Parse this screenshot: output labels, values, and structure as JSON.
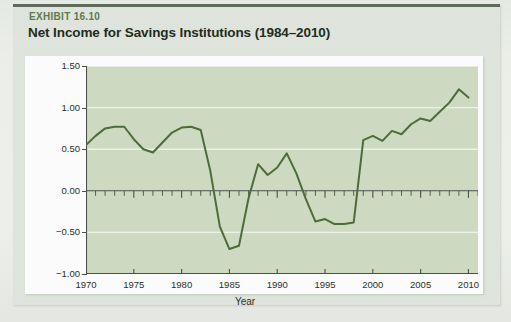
{
  "exhibit": {
    "label": "EXHIBIT 16.10",
    "title": "Net Income for Savings Institutions (1984–2010)",
    "label_color": "#5d7a4e",
    "title_color": "#1d2b20",
    "card_bg": "#dfe5dc",
    "panel_bg": "#fbfcfb",
    "rule_color": "#5e6b5c"
  },
  "chart_data": {
    "type": "line",
    "title": "Net Income for Savings Institutions (1984–2010)",
    "xlabel": "Year",
    "ylabel": "Percent of assets",
    "xlim": [
      1970,
      2011
    ],
    "ylim": [
      -1.0,
      1.5
    ],
    "xticks": [
      1970,
      1975,
      1980,
      1985,
      1990,
      1995,
      2000,
      2005,
      2010
    ],
    "xtick_labels": [
      "1970",
      "1975",
      "1980",
      "1985",
      "1990",
      "1995",
      "2000",
      "2005",
      "2010"
    ],
    "yticks": [
      -1.0,
      -0.5,
      0.0,
      0.5,
      1.0,
      1.5
    ],
    "ytick_labels": [
      "−1.00",
      "−0.50",
      "0.00",
      "0.50",
      "1.00",
      "1.50"
    ],
    "minor_x_tick_interval": 1,
    "grid": true,
    "grid_color": "#eef3ea",
    "plot_bg": "#cddbc1",
    "legend": null,
    "line_color": "#4e6b3b",
    "line_width": 2.0,
    "series": [
      {
        "name": "Net income",
        "x": [
          1970,
          1971,
          1972,
          1973,
          1974,
          1975,
          1976,
          1977,
          1978,
          1979,
          1980,
          1981,
          1982,
          1983,
          1984,
          1985,
          1986,
          1987,
          1988,
          1989,
          1990,
          1991,
          1992,
          1993,
          1994,
          1995,
          1996,
          1997,
          1998,
          1999,
          2000,
          2001,
          2002,
          2003,
          2004,
          2005,
          2006,
          2007,
          2008,
          2009,
          2010
        ],
        "values": [
          0.55,
          0.66,
          0.75,
          0.77,
          0.77,
          0.62,
          0.5,
          0.46,
          0.58,
          0.7,
          0.76,
          0.77,
          0.73,
          0.24,
          -0.43,
          -0.7,
          -0.66,
          -0.09,
          0.32,
          0.19,
          0.28,
          0.45,
          0.21,
          -0.1,
          -0.37,
          -0.34,
          -0.4,
          -0.4,
          -0.38,
          0.61,
          0.66,
          0.6,
          0.72,
          0.68,
          0.8,
          0.87,
          0.84,
          0.95,
          1.06,
          1.22,
          1.12
        ]
      }
    ],
    "note": "Line traced from the figure; the 1980s S&L crisis trough and the 2008 crisis trough are the two deepest points."
  },
  "axes": {
    "y_label": "Percent of assets",
    "x_label": "Year"
  }
}
